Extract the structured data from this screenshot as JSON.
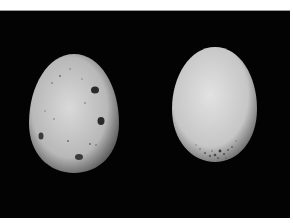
{
  "image": {
    "description": "Photograph of two eggs on a black background",
    "background_color": "#030303",
    "eggs": [
      {
        "id": "left",
        "description": "Speckled egg with several large dark blotches",
        "shell_color": "#c9c9c9",
        "bbox": [
          29,
          53,
          90,
          119
        ],
        "blotches": [
          [
            95,
            88,
            7,
            6
          ],
          [
            101,
            120,
            7,
            7
          ],
          [
            41,
            135,
            5,
            7
          ],
          [
            79,
            156,
            7,
            5
          ]
        ]
      },
      {
        "id": "right",
        "description": "Pale egg with fine speckling concentrated at the broad lower end",
        "shell_color": "#d4d4d4",
        "bbox": [
          172,
          46,
          85,
          115
        ]
      }
    ]
  }
}
